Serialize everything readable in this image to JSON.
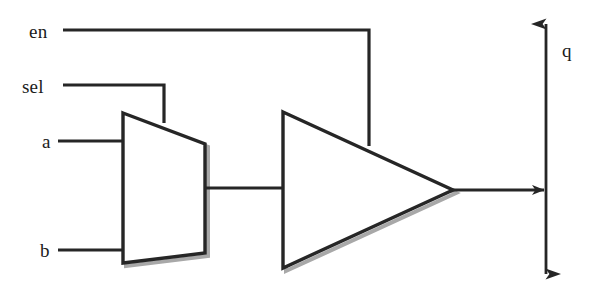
{
  "diagram": {
    "type": "logic-circuit-schematic",
    "background_color": "#ffffff",
    "line_color": "#262626",
    "shadow_color": "#a8a8a8",
    "labels": {
      "en": "en",
      "sel": "sel",
      "a": "a",
      "b": "b",
      "q": "q"
    },
    "components": [
      {
        "name": "multiplexer",
        "shape": "trapezoid",
        "inputs": [
          "a",
          "b"
        ],
        "select": "sel",
        "output": "mux-out"
      },
      {
        "name": "tristate-buffer",
        "shape": "triangle",
        "inputs": [
          "mux-out"
        ],
        "enable": "en",
        "output": "q"
      }
    ],
    "nets": [
      {
        "name": "en-net",
        "from": "en",
        "to": "tristate-buffer.enable"
      },
      {
        "name": "sel-net",
        "from": "sel",
        "to": "multiplexer.select"
      },
      {
        "name": "a-net",
        "from": "a",
        "to": "multiplexer.in0"
      },
      {
        "name": "b-net",
        "from": "b",
        "to": "multiplexer.in1"
      },
      {
        "name": "mux-out-net",
        "from": "multiplexer.out",
        "to": "tristate-buffer.in"
      },
      {
        "name": "q-net",
        "from": "tristate-buffer.out",
        "to": "q-bus"
      }
    ],
    "q_bus": {
      "name": "q-bus",
      "orientation": "vertical",
      "arrowheads": "both"
    }
  }
}
